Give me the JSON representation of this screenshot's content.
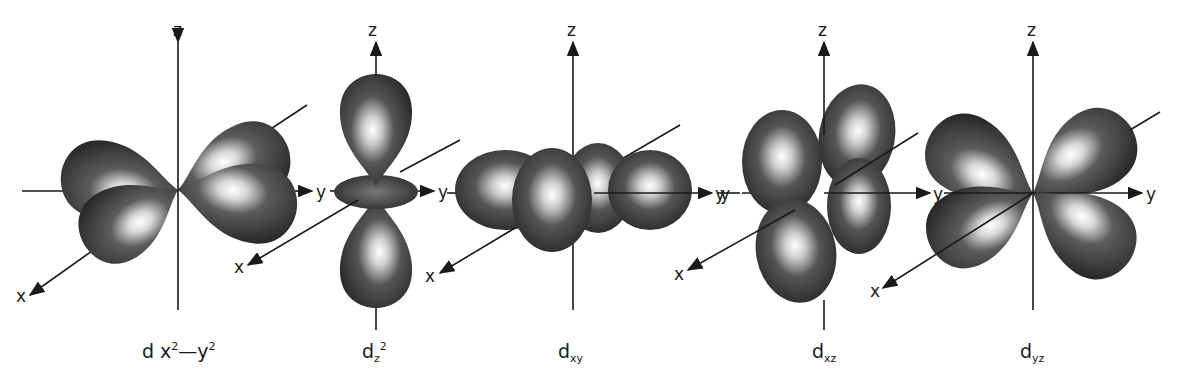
{
  "colors": {
    "lobe_dark": "#2e2e2e",
    "lobe_mid": "#5a5a5a",
    "highlight": "#ffffff",
    "axis": "#1a1a1a"
  },
  "axis_labels": {
    "x": "x",
    "y": "y",
    "z": "z"
  },
  "orbitals": [
    {
      "id": "dx2-y2",
      "label_base": "d x",
      "label_sup1": "2",
      "label_mid": "—y",
      "label_sup2": "2",
      "caption_x": 142,
      "center": [
        178,
        190
      ]
    },
    {
      "id": "dz2",
      "label_base": "d",
      "label_sub": "z",
      "label_sup": "2",
      "caption_x": 352,
      "center": [
        376,
        190
      ]
    },
    {
      "id": "dxy",
      "label_base": "d",
      "label_sub": "xy",
      "caption_x": 556,
      "center": [
        573,
        193
      ]
    },
    {
      "id": "dxz",
      "label_base": "d",
      "label_sub": "xz",
      "caption_x": 812,
      "center": [
        824,
        193
      ]
    },
    {
      "id": "dyz",
      "label_base": "d",
      "label_sub": "yz",
      "caption_x": 1018,
      "center": [
        1033,
        193
      ]
    }
  ]
}
